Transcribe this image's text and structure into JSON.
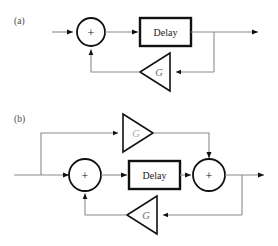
{
  "figure": {
    "title_a": "(a)",
    "title_b": "(b)",
    "panels": [
      {
        "id": "a",
        "label": "(a)",
        "blocks": {
          "delay_label": "Delay",
          "sum_sign": "+",
          "gain_label": "G"
        }
      },
      {
        "id": "b",
        "label": "(b)",
        "blocks": {
          "delay_label": "Delay",
          "sum_sign_left": "+",
          "sum_sign_right": "+",
          "gain_label_top": "G",
          "gain_label_bottom": "G"
        }
      }
    ],
    "colors": {
      "wire": "#8c8c8c",
      "outline": "#111111",
      "background": "#ffffff",
      "gain_text": "#6e6e6e",
      "gain_text_faint": "#a8a8a8",
      "panel_label": "#4a4a4a"
    }
  }
}
